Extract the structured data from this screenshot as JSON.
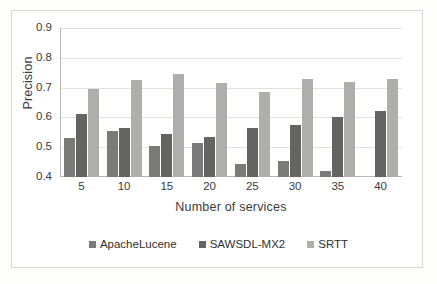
{
  "chart_data": {
    "type": "bar",
    "title": "",
    "xlabel": "Number of services",
    "ylabel": "Precision",
    "categories": [
      "5",
      "10",
      "15",
      "20",
      "25",
      "30",
      "35",
      "40"
    ],
    "series": [
      {
        "name": "ApacheLucene",
        "color": "#7a7a78",
        "values": [
          0.53,
          0.555,
          0.505,
          0.515,
          0.445,
          0.455,
          0.42,
          0.4
        ]
      },
      {
        "name": "SAWSDL-MX2",
        "color": "#646463",
        "values": [
          0.61,
          0.565,
          0.545,
          0.535,
          0.565,
          0.575,
          0.6,
          0.62
        ]
      },
      {
        "name": "SRTT",
        "color": "#aeaeab",
        "values": [
          0.695,
          0.725,
          0.745,
          0.715,
          0.685,
          0.73,
          0.72,
          0.73
        ]
      }
    ],
    "ylim": [
      0.4,
      0.9
    ],
    "yticks": [
      "0.9",
      "0.8",
      "0.7",
      "0.6",
      "0.5",
      "0.4"
    ],
    "ytick_values": [
      0.9,
      0.8,
      0.7,
      0.6,
      0.5,
      0.4
    ],
    "grid": true,
    "legend_position": "bottom"
  }
}
